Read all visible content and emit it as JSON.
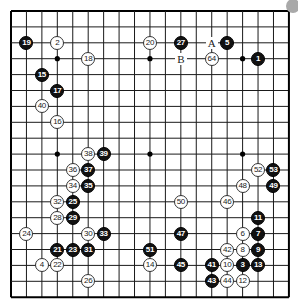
{
  "board": {
    "size": 19,
    "origin_x": 11,
    "origin_y": 11,
    "step_x": 15.44,
    "step_y": 15.9,
    "line_color": "#1a1a1a",
    "border_color": "#000000",
    "star_points": [
      [
        3,
        3
      ],
      [
        9,
        3
      ],
      [
        15,
        3
      ],
      [
        3,
        9
      ],
      [
        9,
        9
      ],
      [
        15,
        9
      ],
      [
        3,
        15
      ],
      [
        9,
        15
      ],
      [
        15,
        15
      ]
    ]
  },
  "stones": [
    {
      "n": "1",
      "color": "black",
      "c": 16,
      "r": 3
    },
    {
      "n": "2",
      "color": "white",
      "c": 3,
      "r": 2
    },
    {
      "n": "3",
      "color": "black",
      "c": 15,
      "r": 16
    },
    {
      "n": "4",
      "color": "white",
      "c": 2,
      "r": 16
    },
    {
      "n": "5",
      "color": "black",
      "c": 14,
      "r": 2
    },
    {
      "n": "6",
      "color": "white",
      "c": 15,
      "r": 14
    },
    {
      "n": "7",
      "color": "black",
      "c": 16,
      "r": 14
    },
    {
      "n": "8",
      "color": "white",
      "c": 15,
      "r": 15
    },
    {
      "n": "9",
      "color": "black",
      "c": 16,
      "r": 15
    },
    {
      "n": "10",
      "color": "white",
      "c": 14,
      "r": 16
    },
    {
      "n": "11",
      "color": "black",
      "c": 16,
      "r": 13
    },
    {
      "n": "12",
      "color": "white",
      "c": 15,
      "r": 17
    },
    {
      "n": "13",
      "color": "black",
      "c": 16,
      "r": 16
    },
    {
      "n": "14",
      "color": "white",
      "c": 9,
      "r": 16
    },
    {
      "n": "15",
      "color": "black",
      "c": 2,
      "r": 4
    },
    {
      "n": "16",
      "color": "white",
      "c": 3,
      "r": 7
    },
    {
      "n": "17",
      "color": "black",
      "c": 3,
      "r": 5
    },
    {
      "n": "18",
      "color": "white",
      "c": 5,
      "r": 3
    },
    {
      "n": "19",
      "color": "black",
      "c": 1,
      "r": 2
    },
    {
      "n": "20",
      "color": "white",
      "c": 9,
      "r": 2
    },
    {
      "n": "21",
      "color": "black",
      "c": 3,
      "r": 15
    },
    {
      "n": "22",
      "color": "white",
      "c": 3,
      "r": 16
    },
    {
      "n": "23",
      "color": "black",
      "c": 4,
      "r": 15
    },
    {
      "n": "24",
      "color": "white",
      "c": 1,
      "r": 14
    },
    {
      "n": "25",
      "color": "black",
      "c": 4,
      "r": 12
    },
    {
      "n": "26",
      "color": "white",
      "c": 5,
      "r": 17
    },
    {
      "n": "27",
      "color": "black",
      "c": 11,
      "r": 2
    },
    {
      "n": "28",
      "color": "white",
      "c": 3,
      "r": 13
    },
    {
      "n": "29",
      "color": "black",
      "c": 4,
      "r": 13
    },
    {
      "n": "30",
      "color": "white",
      "c": 5,
      "r": 14
    },
    {
      "n": "31",
      "color": "black",
      "c": 5,
      "r": 15
    },
    {
      "n": "32",
      "color": "white",
      "c": 3,
      "r": 12
    },
    {
      "n": "33",
      "color": "black",
      "c": 6,
      "r": 14
    },
    {
      "n": "34",
      "color": "white",
      "c": 4,
      "r": 11
    },
    {
      "n": "35",
      "color": "black",
      "c": 5,
      "r": 11
    },
    {
      "n": "36",
      "color": "white",
      "c": 4,
      "r": 10
    },
    {
      "n": "37",
      "color": "black",
      "c": 5,
      "r": 10
    },
    {
      "n": "38",
      "color": "white",
      "c": 5,
      "r": 9
    },
    {
      "n": "39",
      "color": "black",
      "c": 6,
      "r": 9
    },
    {
      "n": "40",
      "color": "white",
      "c": 2,
      "r": 6
    },
    {
      "n": "41",
      "color": "black",
      "c": 13,
      "r": 16
    },
    {
      "n": "42",
      "color": "white",
      "c": 14,
      "r": 15
    },
    {
      "n": "43",
      "color": "black",
      "c": 13,
      "r": 17
    },
    {
      "n": "44",
      "color": "white",
      "c": 14,
      "r": 17
    },
    {
      "n": "45",
      "color": "black",
      "c": 11,
      "r": 16
    },
    {
      "n": "46",
      "color": "white",
      "c": 14,
      "r": 12
    },
    {
      "n": "47",
      "color": "black",
      "c": 11,
      "r": 14
    },
    {
      "n": "48",
      "color": "white",
      "c": 15,
      "r": 11
    },
    {
      "n": "49",
      "color": "black",
      "c": 17,
      "r": 11
    },
    {
      "n": "50",
      "color": "white",
      "c": 11,
      "r": 12
    },
    {
      "n": "51",
      "color": "black",
      "c": 9,
      "r": 15
    },
    {
      "n": "52",
      "color": "white",
      "c": 16,
      "r": 10
    },
    {
      "n": "53",
      "color": "black",
      "c": 17,
      "r": 10
    },
    {
      "n": "64",
      "color": "white",
      "c": 13,
      "r": 3
    }
  ],
  "marks": [
    {
      "label": "A",
      "c": 13,
      "r": 2
    },
    {
      "label": "B",
      "c": 11,
      "r": 3
    }
  ],
  "corner_button": {
    "color": "#a9a9a9"
  }
}
